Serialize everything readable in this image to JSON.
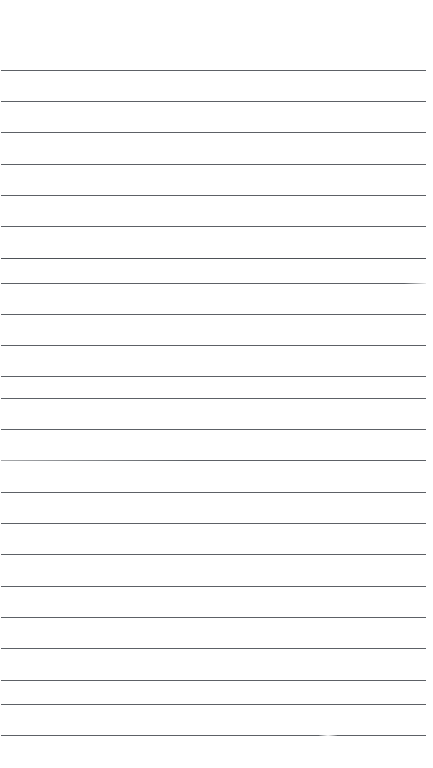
{
  "page": {
    "kind": "lined-paper",
    "width": 433,
    "height": 768,
    "background_color": "#ffffff",
    "line_color": "#5d6166",
    "line_thickness_px": 1,
    "line_count": 22,
    "first_line_y": 70,
    "line_spacing_px": 31.4,
    "line_start_x": 1,
    "line_end_x": 426,
    "top_margin_px": 70,
    "bottom_margin_px": 33,
    "content_text": ""
  },
  "ruled_lines": [
    {
      "index": 1,
      "y": 70,
      "x1": 1,
      "x2": 426,
      "style": "normal"
    },
    {
      "index": 2,
      "y": 101,
      "x1": 1,
      "x2": 426,
      "style": "normal"
    },
    {
      "index": 3,
      "y": 132,
      "x1": 1,
      "x2": 426,
      "style": "normal"
    },
    {
      "index": 4,
      "y": 164,
      "x1": 1,
      "x2": 426,
      "style": "normal"
    },
    {
      "index": 5,
      "y": 195,
      "x1": 1,
      "x2": 426,
      "style": "normal"
    },
    {
      "index": 6,
      "y": 226,
      "x1": 1,
      "x2": 426,
      "style": "normal"
    },
    {
      "index": 7,
      "y": 258,
      "x1": 1,
      "x2": 426,
      "style": "dark"
    },
    {
      "index": 8,
      "y": 283,
      "x1": 1,
      "x2": 426,
      "style": "fade-right"
    },
    {
      "index": 9,
      "y": 314,
      "x1": 1,
      "x2": 426,
      "style": "normal"
    },
    {
      "index": 10,
      "y": 345,
      "x1": 1,
      "x2": 426,
      "style": "normal"
    },
    {
      "index": 11,
      "y": 376,
      "x1": 1,
      "x2": 426,
      "style": "normal"
    },
    {
      "index": 12,
      "y": 398,
      "x1": 1,
      "x2": 426,
      "style": "normal"
    },
    {
      "index": 13,
      "y": 429,
      "x1": 1,
      "x2": 426,
      "style": "normal"
    },
    {
      "index": 14,
      "y": 460,
      "x1": 1,
      "x2": 426,
      "style": "fade-left"
    },
    {
      "index": 15,
      "y": 492,
      "x1": 1,
      "x2": 426,
      "style": "normal"
    },
    {
      "index": 16,
      "y": 523,
      "x1": 1,
      "x2": 426,
      "style": "normal"
    },
    {
      "index": 17,
      "y": 554,
      "x1": 1,
      "x2": 426,
      "style": "normal"
    },
    {
      "index": 18,
      "y": 586,
      "x1": 1,
      "x2": 426,
      "style": "normal"
    },
    {
      "index": 19,
      "y": 617,
      "x1": 1,
      "x2": 426,
      "style": "normal"
    },
    {
      "index": 20,
      "y": 648,
      "x1": 1,
      "x2": 426,
      "style": "normal"
    },
    {
      "index": 21,
      "y": 680,
      "x1": 1,
      "x2": 426,
      "style": "normal"
    },
    {
      "index": 22,
      "y": 704,
      "x1": 1,
      "x2": 426,
      "style": "normal"
    },
    {
      "index": 23,
      "y": 735,
      "x1": 1,
      "x2": 426,
      "style": "gap-mid"
    }
  ]
}
